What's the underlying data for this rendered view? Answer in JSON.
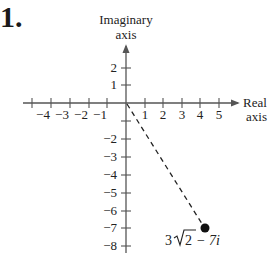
{
  "problem": {
    "number": "1."
  },
  "axes": {
    "y_title_line1": "Imaginary",
    "y_title_line2": "axis",
    "x_title_line1": "Real",
    "x_title_line2": "axis",
    "x_ticks": [
      "−4",
      "−3",
      "−2",
      "−1",
      "1",
      "2",
      "3",
      "4",
      "5"
    ],
    "y_ticks_positive": [
      "2",
      "1"
    ],
    "y_ticks_negative": [
      "−1",
      "−2",
      "−3",
      "−4",
      "−5",
      "−6",
      "−7",
      "−8"
    ]
  },
  "point": {
    "label_prefix": "3",
    "label_radicand": "2",
    "label_suffix": " − 7i",
    "real": 4.243,
    "imaginary": -7
  },
  "colors": {
    "ink": "#1a1a1a",
    "axis": "#444444"
  }
}
